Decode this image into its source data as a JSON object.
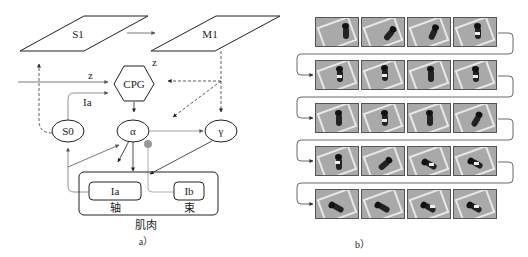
{
  "figure_a": {
    "caption": "a）",
    "nodes": {
      "s1": "S1",
      "m1": "M1",
      "cpg": "CPG",
      "s0": "S0",
      "alpha": "α",
      "gamma": "γ",
      "ia": "Ia",
      "ib": "Ib"
    },
    "edge_labels": {
      "z_input": "z",
      "z_cpg": "z",
      "ia_feedback": "Ia"
    },
    "muscle": {
      "spindle_label": "轴",
      "tendon_label": "束",
      "title": "肌肉"
    }
  },
  "figure_b": {
    "caption": "b）",
    "rows": 5,
    "columns": 4,
    "frames": [
      [
        "frame-1",
        "frame-2",
        "frame-3",
        "frame-4"
      ],
      [
        "frame-5",
        "frame-6",
        "frame-7",
        "frame-8"
      ],
      [
        "frame-9",
        "frame-10",
        "frame-11",
        "frame-12"
      ],
      [
        "frame-13",
        "frame-14",
        "frame-15",
        "frame-16"
      ],
      [
        "frame-17",
        "frame-18",
        "frame-19",
        "frame-20"
      ]
    ]
  },
  "colors": {
    "line": "#222222",
    "feedback_line": "#888888",
    "inhibitory_dot": "#999999",
    "frame_bg": "#a9a9a9",
    "mat": "#e8e8e8"
  }
}
